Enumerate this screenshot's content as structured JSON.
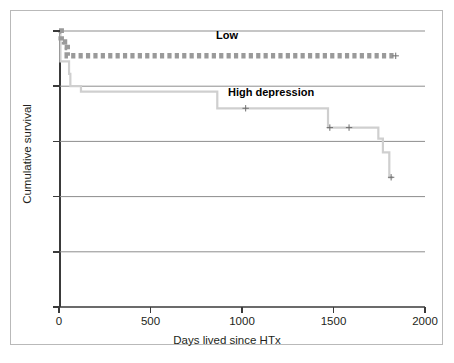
{
  "chart_data": {
    "type": "line",
    "subtype": "kaplan-meier-step",
    "title": "",
    "xlabel": "Days lived since HTx",
    "ylabel": "Cumulative survival",
    "xlim": [
      0,
      2000
    ],
    "ylim": [
      0.0,
      1.0
    ],
    "xticks": [
      0,
      500,
      1000,
      1500,
      2000
    ],
    "xtick_labels": [
      "0",
      "500",
      "1000",
      "1500",
      "2000"
    ],
    "yticks": [
      0.0,
      0.2,
      0.4,
      0.6,
      0.8,
      1.0
    ],
    "ytick_labels": [
      "0,0",
      "0,2",
      "0,4",
      "0,6",
      "0,8",
      "1,0"
    ],
    "grid": true,
    "grid_axis": "y",
    "legend_position": "inline-annotations",
    "series": [
      {
        "name": "Low",
        "label": "Low",
        "style": "dashed-square-markers",
        "color": "#9a9a9a",
        "steps": [
          {
            "x": 0,
            "y": 1.0
          },
          {
            "x": 12,
            "y": 0.96
          },
          {
            "x": 30,
            "y": 0.94
          },
          {
            "x": 45,
            "y": 0.91
          },
          {
            "x": 1830,
            "y": 0.91
          }
        ],
        "censored": [
          {
            "x": 1840,
            "y": 0.91
          }
        ]
      },
      {
        "name": "High depression",
        "label": "High depression",
        "style": "solid-step",
        "color": "#cfcfcf",
        "steps": [
          {
            "x": 0,
            "y": 1.0
          },
          {
            "x": 8,
            "y": 0.89
          },
          {
            "x": 55,
            "y": 0.845
          },
          {
            "x": 62,
            "y": 0.8
          },
          {
            "x": 120,
            "y": 0.78
          },
          {
            "x": 865,
            "y": 0.72
          },
          {
            "x": 1470,
            "y": 0.65
          },
          {
            "x": 1745,
            "y": 0.61
          },
          {
            "x": 1770,
            "y": 0.56
          },
          {
            "x": 1805,
            "y": 0.47
          },
          {
            "x": 1825,
            "y": 0.47
          }
        ],
        "censored": [
          {
            "x": 1020,
            "y": 0.72
          },
          {
            "x": 1480,
            "y": 0.65
          },
          {
            "x": 1585,
            "y": 0.65
          },
          {
            "x": 1815,
            "y": 0.47
          }
        ]
      }
    ]
  },
  "axis": {
    "x_title": "Days lived since HTx",
    "y_title": "Cumulative survival"
  },
  "annotations": {
    "low_label": "Low",
    "high_label": "High depression"
  },
  "colors": {
    "low_series": "#9a9a9a",
    "high_series": "#cfcfcf",
    "gridline": "#8d8d8d",
    "axis": "#3a3a3a",
    "frame": "#b9b9b9",
    "text": "#231f20"
  }
}
